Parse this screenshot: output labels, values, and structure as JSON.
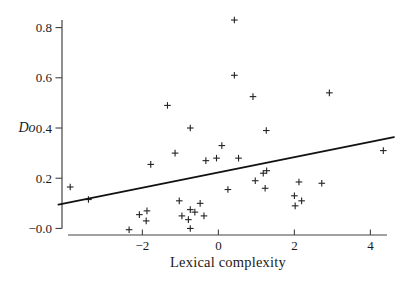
{
  "figure": {
    "ylabel": "Do",
    "xlabel": "Lexical complexity"
  },
  "chart_data": {
    "type": "scatter",
    "title": "",
    "xlabel": "Lexical complexity",
    "ylabel": "Do",
    "xlim": [
      -4.3,
      4.7
    ],
    "ylim": [
      -0.05,
      0.87
    ],
    "x_ticks": [
      -2,
      0,
      2,
      4
    ],
    "x_tick_labels": [
      "−2",
      "0",
      "2",
      "4"
    ],
    "y_ticks": [
      0.8,
      0.6,
      0.4,
      0.2,
      0.0
    ],
    "y_tick_labels": [
      "0.8",
      "0.6",
      "0.4",
      "0.2",
      "−0.0"
    ],
    "grid": false,
    "legend": null,
    "marker": "plus",
    "marker_color": "#222222",
    "line_color": "#111111",
    "axis_color": "#444444",
    "points": [
      [
        -3.9,
        0.165
      ],
      [
        -3.42,
        0.115
      ],
      [
        -2.35,
        -0.005
      ],
      [
        -2.08,
        0.055
      ],
      [
        -1.9,
        0.03
      ],
      [
        -1.88,
        0.07
      ],
      [
        -1.78,
        0.255
      ],
      [
        -1.34,
        0.49
      ],
      [
        -1.14,
        0.3
      ],
      [
        -1.03,
        0.11
      ],
      [
        -0.96,
        0.05
      ],
      [
        -0.79,
        0.035
      ],
      [
        -0.74,
        0.075
      ],
      [
        -0.74,
        0.4
      ],
      [
        -0.74,
        0.0
      ],
      [
        -0.62,
        0.065
      ],
      [
        -0.48,
        0.1
      ],
      [
        -0.38,
        0.05
      ],
      [
        -0.33,
        0.27
      ],
      [
        -0.05,
        0.28
      ],
      [
        0.09,
        0.33
      ],
      [
        0.25,
        0.155
      ],
      [
        0.42,
        0.83
      ],
      [
        0.42,
        0.61
      ],
      [
        0.53,
        0.28
      ],
      [
        0.91,
        0.525
      ],
      [
        0.97,
        0.19
      ],
      [
        1.18,
        0.22
      ],
      [
        1.23,
        0.16
      ],
      [
        1.26,
        0.39
      ],
      [
        1.27,
        0.23
      ],
      [
        2.0,
        0.13
      ],
      [
        2.02,
        0.09
      ],
      [
        2.12,
        0.185
      ],
      [
        2.19,
        0.11
      ],
      [
        2.72,
        0.18
      ],
      [
        2.92,
        0.54
      ],
      [
        4.34,
        0.31
      ]
    ],
    "trend_line": {
      "x1": -4.21,
      "y1": 0.095,
      "x2": 4.62,
      "y2": 0.364,
      "equation": "y = 0.225 + 0.031x"
    }
  }
}
